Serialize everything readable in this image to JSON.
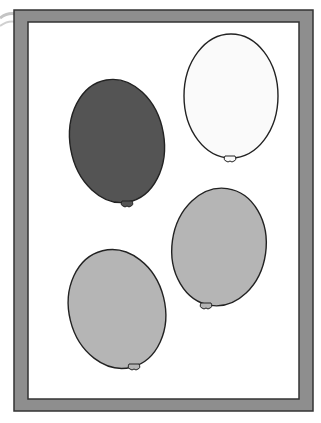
{
  "page": {
    "type": "worksheet-illustration",
    "background": "#ffffff"
  },
  "frame": {
    "outer": {
      "x": 14,
      "y": 10,
      "w": 299,
      "h": 401
    },
    "inner": {
      "x": 28,
      "y": 22,
      "w": 271,
      "h": 377
    },
    "fill": "#8e8e8e",
    "stroke": "#333333"
  },
  "curl": {
    "stroke": "#b8b8b8"
  },
  "balloons": [
    {
      "name": "dark-balloon",
      "cx": 117,
      "cy": 141,
      "rx": 47,
      "ry": 62,
      "rotate": -10,
      "fill": "#545454",
      "knot": {
        "x": 127,
        "y": 203
      }
    },
    {
      "name": "white-balloon",
      "cx": 231,
      "cy": 96,
      "rx": 47,
      "ry": 62,
      "rotate": 0,
      "fill": "#fafafa",
      "knot": {
        "x": 230,
        "y": 158
      }
    },
    {
      "name": "gray-balloon-right",
      "cx": 219,
      "cy": 247,
      "rx": 47,
      "ry": 59,
      "rotate": 8,
      "fill": "#b5b5b5",
      "knot": {
        "x": 206,
        "y": 305
      }
    },
    {
      "name": "gray-balloon-left",
      "cx": 117,
      "cy": 309,
      "rx": 48,
      "ry": 60,
      "rotate": -14,
      "fill": "#b5b5b5",
      "knot": {
        "x": 134,
        "y": 366
      }
    }
  ]
}
